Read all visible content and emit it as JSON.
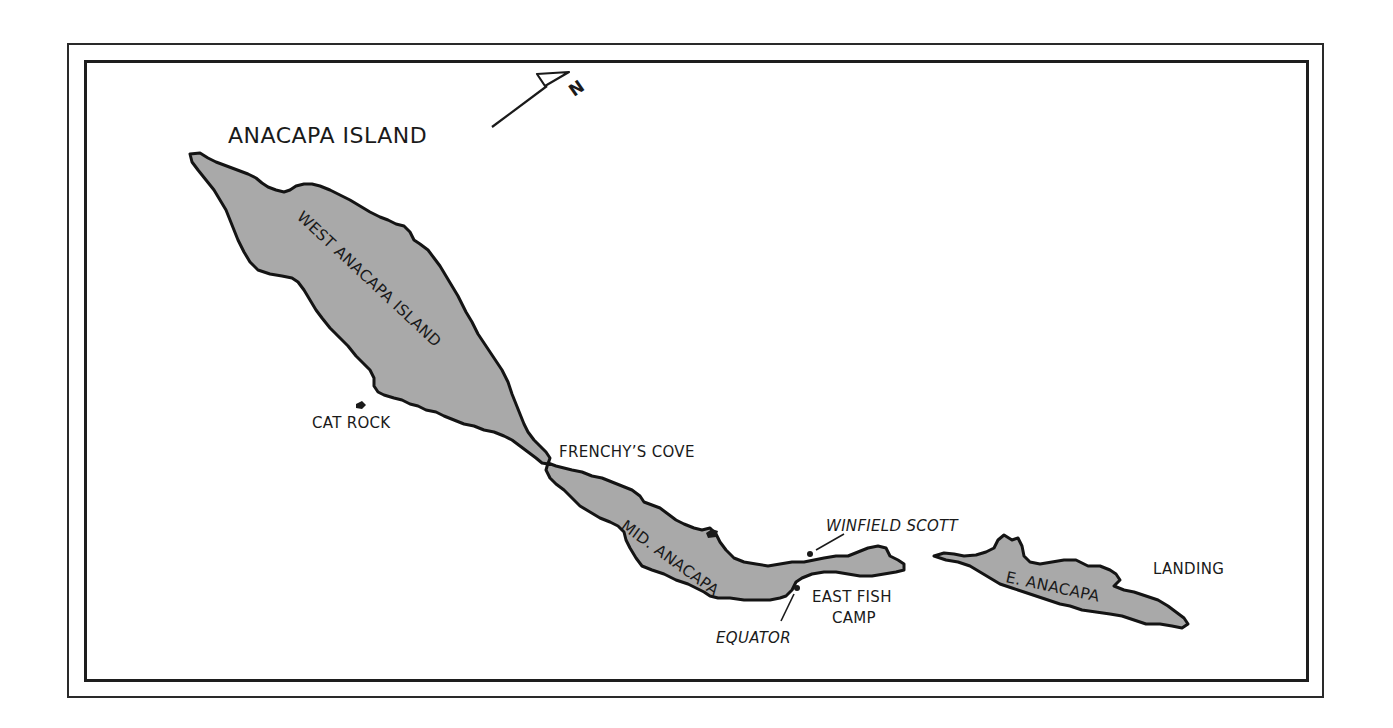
{
  "map": {
    "title": "ANACAPA ISLAND",
    "north_arrow": {
      "label": "N",
      "icon": "north-arrow-icon"
    },
    "colors": {
      "land": "#a9a9a9",
      "coastline": "#141414",
      "water": "#ffffff",
      "frame": "#1e1e1e"
    },
    "islands": [
      {
        "id": "west",
        "label": "WEST ANACAPA ISLAND"
      },
      {
        "id": "mid",
        "label": "MID. ANACAPA"
      },
      {
        "id": "east",
        "label": "E. ANACAPA"
      }
    ],
    "places": [
      {
        "id": "cat_rock",
        "label": "CAT ROCK"
      },
      {
        "id": "frenchys_cove",
        "label": "FRENCHY’S COVE"
      },
      {
        "id": "winfield_scott",
        "label": "WINFIELD SCOTT",
        "style": "italic",
        "marker": "dot"
      },
      {
        "id": "east_fish_camp",
        "label_line1": "EAST FISH",
        "label_line2": "CAMP"
      },
      {
        "id": "equator",
        "label": "EQUATOR",
        "style": "italic",
        "marker": "dot"
      },
      {
        "id": "landing",
        "label": "LANDING"
      }
    ]
  }
}
